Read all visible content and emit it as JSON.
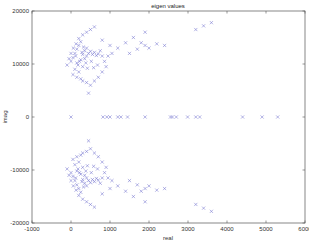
{
  "chart_data": {
    "type": "scatter",
    "title": "eigen values",
    "xlabel": "real",
    "ylabel": "imag",
    "xlim": [
      -1000,
      6000
    ],
    "ylim": [
      -20000,
      20000
    ],
    "xticks": [
      -1000,
      0,
      1000,
      2000,
      3000,
      4000,
      5000,
      6000
    ],
    "yticks": [
      -20000,
      -10000,
      0,
      10000,
      20000
    ],
    "xtick_labels": [
      "-1000",
      "0",
      "1000",
      "2000",
      "3000",
      "4000",
      "5000",
      "6000"
    ],
    "ytick_labels": [
      "-20000",
      "-10000",
      "0",
      "10000",
      "20000"
    ],
    "grid": false,
    "legend": null,
    "marker": "x",
    "marker_color": "#6b6bcc",
    "series": [
      {
        "name": "eigenvalues (upper half)",
        "points": [
          [
            -100,
            9800
          ],
          [
            0,
            10500
          ],
          [
            50,
            11200
          ],
          [
            100,
            12000
          ],
          [
            150,
            12800
          ],
          [
            200,
            13500
          ],
          [
            250,
            14200
          ],
          [
            300,
            11800
          ],
          [
            350,
            12500
          ],
          [
            400,
            13000
          ],
          [
            100,
            9000
          ],
          [
            200,
            8500
          ],
          [
            300,
            9500
          ],
          [
            150,
            10200
          ],
          [
            250,
            10800
          ],
          [
            350,
            11000
          ],
          [
            400,
            11500
          ],
          [
            450,
            12000
          ],
          [
            500,
            12400
          ],
          [
            550,
            11800
          ],
          [
            600,
            12200
          ],
          [
            650,
            11600
          ],
          [
            700,
            11900
          ],
          [
            750,
            12500
          ],
          [
            800,
            11500
          ],
          [
            50,
            8000
          ],
          [
            150,
            7500
          ],
          [
            250,
            7200
          ],
          [
            300,
            6800
          ],
          [
            400,
            6500
          ],
          [
            500,
            6000
          ],
          [
            600,
            6800
          ],
          [
            700,
            7500
          ],
          [
            800,
            8500
          ],
          [
            900,
            9500
          ],
          [
            450,
            4500
          ],
          [
            200,
            14800
          ],
          [
            300,
            15500
          ],
          [
            400,
            16000
          ],
          [
            500,
            16500
          ],
          [
            600,
            17000
          ],
          [
            800,
            14500
          ],
          [
            1000,
            13500
          ],
          [
            1200,
            13000
          ],
          [
            1400,
            14000
          ],
          [
            1600,
            15000
          ],
          [
            1800,
            14000
          ],
          [
            1900,
            13500
          ],
          [
            1700,
            12800
          ],
          [
            1500,
            12000
          ],
          [
            2000,
            13000
          ],
          [
            2200,
            13800
          ],
          [
            2400,
            13500
          ],
          [
            1900,
            16000
          ],
          [
            3200,
            16500
          ],
          [
            3400,
            17200
          ],
          [
            3600,
            17800
          ],
          [
            -50,
            11000
          ],
          [
            0,
            12000
          ],
          [
            120,
            11500
          ],
          [
            180,
            9800
          ],
          [
            220,
            10500
          ],
          [
            280,
            12200
          ],
          [
            320,
            13200
          ],
          [
            60,
            13000
          ],
          [
            130,
            13800
          ],
          [
            380,
            10200
          ],
          [
            420,
            9200
          ],
          [
            520,
            10500
          ],
          [
            580,
            9300
          ],
          [
            680,
            9800
          ],
          [
            860,
            10500
          ],
          [
            950,
            11500
          ],
          [
            1050,
            12000
          ]
        ]
      },
      {
        "name": "eigenvalues (real axis)",
        "points": [
          [
            0,
            0
          ],
          [
            820,
            0
          ],
          [
            920,
            0
          ],
          [
            1000,
            0
          ],
          [
            1200,
            0
          ],
          [
            1280,
            0
          ],
          [
            1450,
            0
          ],
          [
            1900,
            0
          ],
          [
            2550,
            0
          ],
          [
            2600,
            0
          ],
          [
            2700,
            0
          ],
          [
            2990,
            0
          ],
          [
            3200,
            0
          ],
          [
            3300,
            0
          ],
          [
            4400,
            0
          ],
          [
            4900,
            0
          ],
          [
            5300,
            0
          ]
        ]
      },
      {
        "name": "eigenvalues (lower half, conjugates)",
        "mirror_of": "eigenvalues (upper half)"
      }
    ]
  }
}
